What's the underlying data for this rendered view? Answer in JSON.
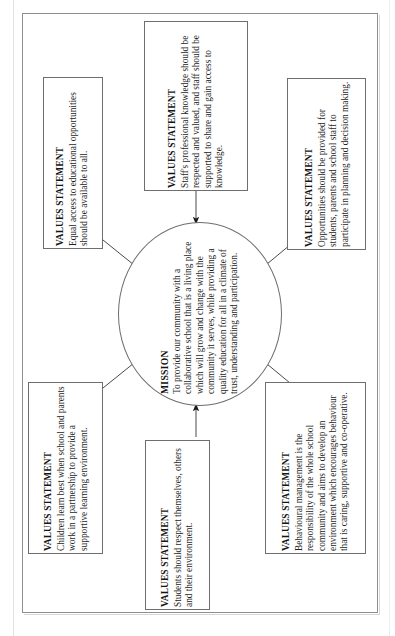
{
  "diagram": {
    "title_label": "Mission and Values Statements",
    "center": {
      "name": "mission",
      "heading": "MISSION",
      "text": "To provide our community with a collaborative school that is a living place which will grow and change with the community it serves, while providing a quality education for all in a climate of trust, understanding and participation."
    },
    "boxes": [
      {
        "id": "values-top-left",
        "heading": "VALUES STATEMENT",
        "text": "Equal access to educational opportunities should be available to all."
      },
      {
        "id": "values-top-middle",
        "heading": "VALUES STATEMENT",
        "text": "Staff's professional knowledge should be respected and valued, and staff should be supported to share and gain access to knowledge."
      },
      {
        "id": "values-top-right",
        "heading": "VALUES STATEMENT",
        "text": "Opportunities should be provided for students, parents and school staff to participate in planning and decision making."
      },
      {
        "id": "values-bottom-left",
        "heading": "VALUES STATEMENT",
        "text": "Children learn best when school and parents work in a partnership to provide a supportive learning environment."
      },
      {
        "id": "values-bottom-middle",
        "heading": "VALUES STATEMENT",
        "text": "Students should respect themselves, others and their environment."
      },
      {
        "id": "values-bottom-right",
        "heading": "VALUES STATEMENT",
        "text": "Behavioural management is the responsibility of the whole school community and aims to develop an environment which encourages behaviour that is caring, supportive and co-operative."
      }
    ],
    "connectors": [
      {
        "id": "arrow-top-left-to-mission",
        "from": "values-top-left",
        "to": "mission"
      },
      {
        "id": "arrow-top-middle-to-mission",
        "from": "values-top-middle",
        "to": "mission"
      },
      {
        "id": "arrow-top-right-to-mission",
        "from": "values-top-right",
        "to": "mission"
      },
      {
        "id": "arrow-bottom-left-to-mission",
        "from": "values-bottom-left",
        "to": "mission"
      },
      {
        "id": "arrow-bottom-middle-to-mission",
        "from": "values-bottom-middle",
        "to": "mission"
      },
      {
        "id": "arrow-bottom-right-to-mission",
        "from": "values-bottom-right",
        "to": "mission"
      }
    ],
    "colors": {
      "stroke": "#6e6e6e",
      "text": "#1d1d1d",
      "background": "#ffffff"
    }
  }
}
